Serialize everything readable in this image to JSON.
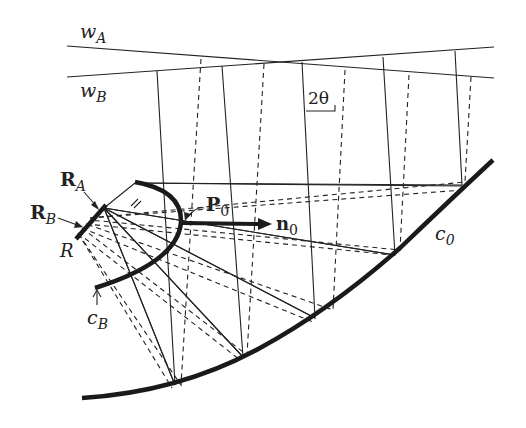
{
  "figure": {
    "type": "optical/geometric construction diagram",
    "labels": {
      "wA_main": "w",
      "wA_sub": "A",
      "wB_main": "w",
      "wB_sub": "B",
      "angle": "2θ",
      "RA_main": "R",
      "RA_sub": "A",
      "RB_main": "R",
      "RB_sub": "B",
      "R": "R",
      "P0_main": "P",
      "P0_sub": "0",
      "n0_main": "n",
      "n0_sub": "0",
      "cB_main": "c",
      "cB_sub": "B",
      "c0_main": "c",
      "c0_sub": "0"
    },
    "elements": {
      "wavefronts": [
        "w_A",
        "w_B"
      ],
      "receiver_segment": "R",
      "receiver_endpoints": [
        "R_A",
        "R_B"
      ],
      "curves": [
        "c_B",
        "c_0"
      ],
      "point": "P_0",
      "normal_vector": "n_0",
      "angle_annotation": "2θ",
      "ray_styles": {
        "solid": "rays from w_A / R_A",
        "dashed": "rays from w_B / R_B"
      }
    },
    "colors": {
      "ink": "#222222",
      "background": "#ffffff"
    }
  }
}
